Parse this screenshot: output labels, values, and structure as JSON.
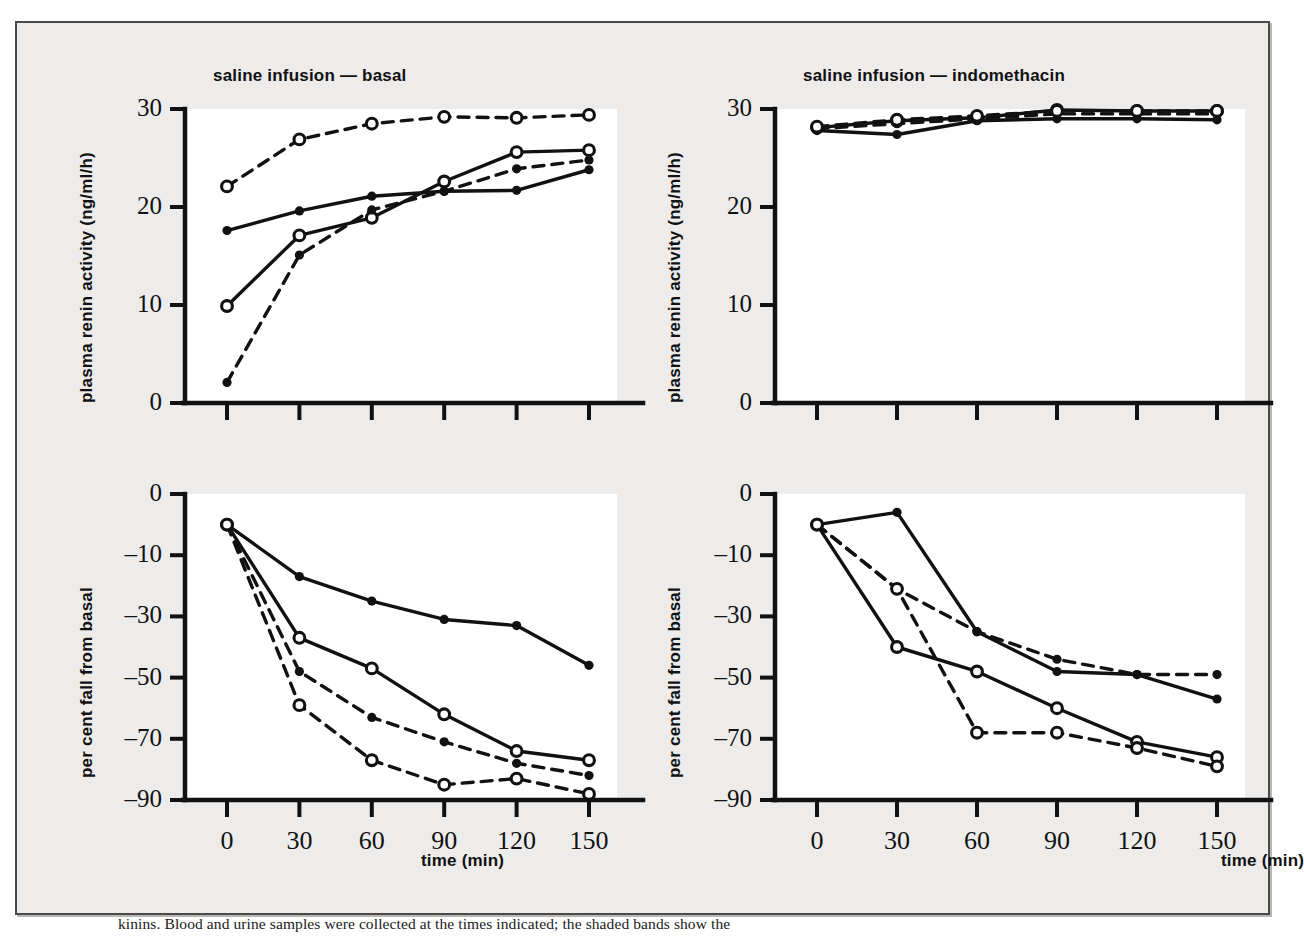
{
  "figure": {
    "background_color": "#edeceb",
    "plot_background_color": "#ffffff",
    "ink_color": "#111111",
    "caption_partial": "kinins. Blood and urine samples were collected at the times indicated; the shaded bands show the"
  },
  "axes": {
    "time_label": "time (min)",
    "time_ticks": [
      "0",
      "30",
      "60",
      "90",
      "120",
      "150"
    ],
    "pra_label": "plasma renin activity (ng/ml/h)",
    "pra_ticks": [
      "0",
      "10",
      "20",
      "30"
    ],
    "fall_label": "per cent fall from basal",
    "fall_ticks": [
      "0",
      "–10",
      "–30",
      "–50",
      "–70",
      "–90"
    ]
  },
  "panels": {
    "top_left_title": "saline infusion — basal",
    "top_right_title": "saline infusion — indomethacin",
    "bottom_left_title": "",
    "bottom_right_title": ""
  },
  "series_styles": [
    {
      "key": "solid_filled",
      "line": "solid",
      "marker": "filled"
    },
    {
      "key": "solid_open",
      "line": "solid",
      "marker": "open"
    },
    {
      "key": "dashed_filled",
      "line": "dashed",
      "marker": "filled"
    },
    {
      "key": "dashed_open",
      "line": "dashed",
      "marker": "open"
    }
  ],
  "chart_data": [
    {
      "id": "pra-basal",
      "type": "line",
      "title": "saline infusion — basal",
      "xlabel": "time (min)",
      "ylabel": "plasma renin activity (ng/ml/h)",
      "x": [
        0,
        30,
        60,
        90,
        120,
        150
      ],
      "xlim": [
        0,
        150
      ],
      "ylim": [
        0,
        30
      ],
      "yticks": [
        0,
        10,
        20,
        30
      ],
      "grid": false,
      "legend": "none",
      "series": [
        {
          "name": "solid_filled",
          "line": "solid",
          "marker": "filled",
          "values": [
            12.4,
            10.4,
            8.9,
            8.4,
            8.3,
            6.2
          ]
        },
        {
          "name": "solid_open",
          "line": "solid",
          "marker": "open",
          "values": [
            20.1,
            12.9,
            11.1,
            7.4,
            4.4,
            4.2
          ]
        },
        {
          "name": "dashed_filled",
          "line": "dashed",
          "marker": "filled",
          "values": [
            27.9,
            14.9,
            10.3,
            8.4,
            6.1,
            5.2
          ]
        },
        {
          "name": "dashed_open",
          "line": "dashed",
          "marker": "open",
          "values": [
            7.9,
            3.1,
            1.5,
            0.8,
            0.9,
            0.6
          ]
        }
      ]
    },
    {
      "id": "pra-indomethacin",
      "type": "line",
      "title": "saline infusion — indomethacin",
      "xlabel": "time (min)",
      "ylabel": "plasma renin activity (ng/ml/h)",
      "x": [
        0,
        30,
        60,
        90,
        120,
        150
      ],
      "xlim": [
        0,
        150
      ],
      "ylim": [
        0,
        30
      ],
      "yticks": [
        0,
        10,
        20,
        30
      ],
      "grid": false,
      "legend": "none",
      "series": [
        {
          "name": "solid_filled",
          "line": "solid",
          "marker": "filled",
          "values": [
            2.2,
            2.6,
            1.2,
            1.0,
            1.0,
            1.1
          ]
        },
        {
          "name": "solid_open",
          "line": "solid",
          "marker": "open",
          "values": [
            1.9,
            1.2,
            0.9,
            0.1,
            0.2,
            0.2
          ]
        },
        {
          "name": "dashed_filled",
          "line": "dashed",
          "marker": "filled",
          "values": [
            2.0,
            1.5,
            1.0,
            0.5,
            0.5,
            0.5
          ]
        },
        {
          "name": "dashed_open",
          "line": "dashed",
          "marker": "open",
          "values": [
            1.8,
            1.1,
            0.7,
            0.2,
            0.2,
            0.2
          ]
        }
      ]
    },
    {
      "id": "fall-basal",
      "type": "line",
      "title": "",
      "xlabel": "time (min)",
      "ylabel": "per cent fall from basal",
      "x": [
        0,
        30,
        60,
        90,
        120,
        150
      ],
      "xlim": [
        0,
        150
      ],
      "ylim": [
        -90,
        0
      ],
      "yticks": [
        0,
        -10,
        -30,
        -50,
        -70,
        -90
      ],
      "grid": false,
      "legend": "none",
      "series": [
        {
          "name": "solid_filled",
          "line": "solid",
          "marker": "filled",
          "values": [
            -5,
            -17,
            -25,
            -31,
            -33,
            -46
          ]
        },
        {
          "name": "solid_open",
          "line": "solid",
          "marker": "open",
          "values": [
            -5,
            -37,
            -47,
            -62,
            -74,
            -77
          ]
        },
        {
          "name": "dashed_filled",
          "line": "dashed",
          "marker": "filled",
          "values": [
            -5,
            -48,
            -63,
            -71,
            -78,
            -82
          ]
        },
        {
          "name": "dashed_open",
          "line": "dashed",
          "marker": "open",
          "values": [
            -5,
            -59,
            -77,
            -85,
            -83,
            -88
          ]
        }
      ]
    },
    {
      "id": "fall-indomethacin",
      "type": "line",
      "title": "",
      "xlabel": "time (min)",
      "ylabel": "per cent fall from basal",
      "x": [
        0,
        30,
        60,
        90,
        120,
        150
      ],
      "xlim": [
        0,
        150
      ],
      "ylim": [
        -90,
        0
      ],
      "yticks": [
        0,
        -10,
        -30,
        -50,
        -70,
        -90
      ],
      "grid": false,
      "legend": "none",
      "series": [
        {
          "name": "solid_filled",
          "line": "solid",
          "marker": "filled",
          "values": [
            -5,
            -3,
            -35,
            -48,
            -49,
            -57
          ]
        },
        {
          "name": "solid_open",
          "line": "solid",
          "marker": "open",
          "values": [
            -5,
            -40,
            -48,
            -60,
            -71,
            -76
          ]
        },
        {
          "name": "dashed_filled",
          "line": "dashed",
          "marker": "filled",
          "values": [
            -5,
            -21,
            -35,
            -44,
            -49,
            -49
          ]
        },
        {
          "name": "dashed_open",
          "line": "dashed",
          "marker": "open",
          "values": [
            -5,
            -21,
            -68,
            -68,
            -73,
            -79
          ]
        }
      ]
    }
  ]
}
